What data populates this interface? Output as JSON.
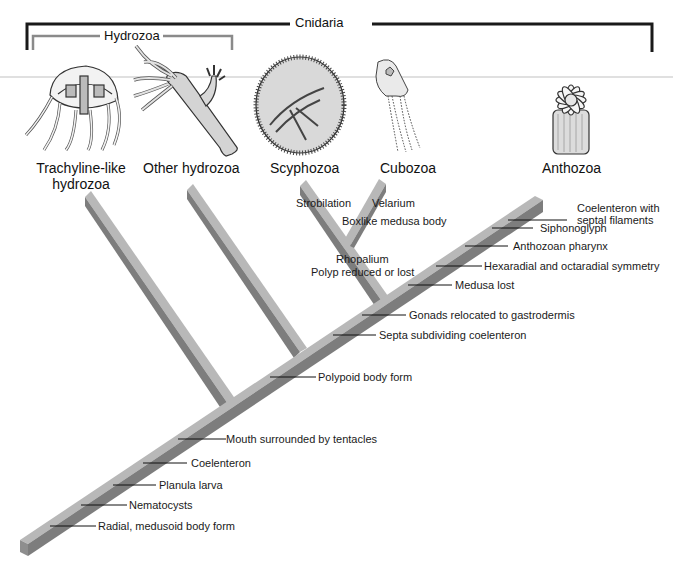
{
  "diagram": {
    "type": "cladogram",
    "title": "Cnidaria",
    "groups": [
      {
        "label": "Cnidaria",
        "color": "#1a1a1a"
      },
      {
        "label": "Hydrozoa",
        "color": "#8a8a8a"
      }
    ],
    "taxa": [
      {
        "label": "Trachyline-like\nhydrozoa",
        "line1": "Trachyline-like",
        "line2": "hydrozoa"
      },
      {
        "label": "Other hydrozoa"
      },
      {
        "label": "Scyphozoa"
      },
      {
        "label": "Cubozoa"
      },
      {
        "label": "Anthozoa"
      }
    ],
    "branch_characters": {
      "scyphozoa": [
        "Strobilation"
      ],
      "cubozoa": [
        "Velarium",
        "Boxlike medusa body"
      ],
      "scypho_cubo_clade": [
        "Rhopalium",
        "Polyp reduced or lost"
      ]
    },
    "trunk_characters": [
      "Coelenteron with",
      "septal filaments",
      "Siphonoglyph",
      "Anthozoan pharynx",
      "Hexaradial and octaradial symmetry",
      "Medusa lost",
      "Gonads relocated to gastrodermis",
      "Septa subdividing coelenteron",
      "Polypoid body form",
      "Mouth surrounded by tentacles",
      "Coelenteron",
      "Planula larva",
      "Nematocysts",
      "Radial, medusoid body form"
    ],
    "colors": {
      "beam_top": "#b8b8b8",
      "beam_front": "#7d7d7d",
      "beam_edge": "#5e5e5e",
      "bracket_cnidaria": "#1a1a1a",
      "bracket_hydrozoa": "#8a8a8a"
    },
    "icons": [
      "jellyfish-trachyline-icon",
      "hydra-polyp-icon",
      "scyphozoan-medusa-icon",
      "box-jellyfish-icon",
      "sea-anemone-icon"
    ]
  }
}
